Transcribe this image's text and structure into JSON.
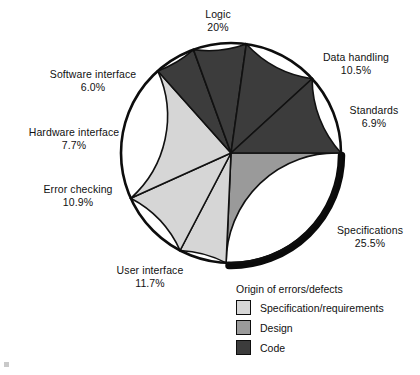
{
  "chart_data": {
    "type": "pie",
    "title": "",
    "legend_title": "Origin of errors/defects",
    "legend_position": "bottom-right",
    "categories": [
      "Specifications",
      "Standards",
      "Data handling",
      "Logic",
      "Software interface",
      "Hardware interface",
      "Error checking",
      "User interface"
    ],
    "values": [
      25.5,
      6.9,
      10.5,
      20,
      6.0,
      7.7,
      10.9,
      11.7
    ],
    "units": "percent",
    "slices": [
      {
        "label": "Specifications",
        "value": 25.5,
        "value_text": "25.5%",
        "group": "Design",
        "color": "#9a9a9a"
      },
      {
        "label": "Standards",
        "value": 6.9,
        "value_text": "6.9%",
        "group": "Specification/requirements",
        "color": "#d6d6d6"
      },
      {
        "label": "Data handling",
        "value": 10.5,
        "value_text": "10.5%",
        "group": "Specification/requirements",
        "color": "#d6d6d6"
      },
      {
        "label": "Logic",
        "value": 20,
        "value_text": "20%",
        "group": "Specification/requirements",
        "color": "#d6d6d6"
      },
      {
        "label": "Software interface",
        "value": 6.0,
        "value_text": "6.0%",
        "group": "Code",
        "color": "#3c3c3c"
      },
      {
        "label": "Hardware interface",
        "value": 7.7,
        "value_text": "7.7%",
        "group": "Code",
        "color": "#3c3c3c"
      },
      {
        "label": "Error checking",
        "value": 10.9,
        "value_text": "10.9%",
        "group": "Code",
        "color": "#3c3c3c"
      },
      {
        "label": "User interface",
        "value": 11.7,
        "value_text": "11.7%",
        "group": "Code",
        "color": "#3c3c3c"
      }
    ],
    "legend_entries": [
      {
        "label": "Specification/requirements",
        "color": "#d6d6d6"
      },
      {
        "label": "Design",
        "color": "#9a9a9a"
      },
      {
        "label": "Code",
        "color": "#3c3c3c"
      }
    ]
  },
  "labels": {
    "logic": {
      "name": "Logic",
      "value": "20%"
    },
    "data_handling": {
      "name": "Data handling",
      "value": "10.5%"
    },
    "standards": {
      "name": "Standards",
      "value": "6.9%"
    },
    "specifications": {
      "name": "Specifications",
      "value": "25.5%"
    },
    "user_interface": {
      "name": "User interface",
      "value": "11.7%"
    },
    "error_checking": {
      "name": "Error checking",
      "value": "10.9%"
    },
    "hardware_interface": {
      "name": "Hardware interface",
      "value": "7.7%"
    },
    "software_interface": {
      "name": "Software interface",
      "value": "6.0%"
    }
  },
  "legend": {
    "title": "Origin of errors/defects",
    "items": [
      {
        "label": "Specification/requirements"
      },
      {
        "label": "Design"
      },
      {
        "label": "Code"
      }
    ]
  },
  "colors": {
    "light": "#d6d6d6",
    "medium": "#9a9a9a",
    "dark": "#3c3c3c",
    "outline": "#0d0d0d",
    "text": "#111111",
    "background": "#ffffff"
  }
}
